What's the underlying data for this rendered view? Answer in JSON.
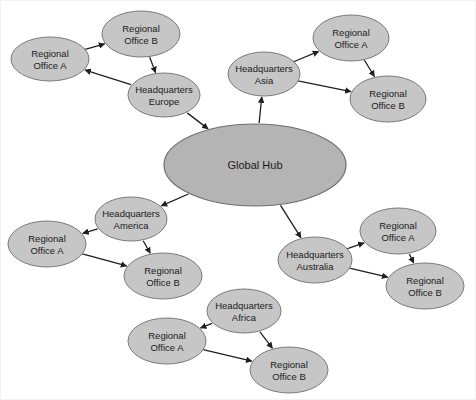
{
  "diagram": {
    "type": "node-link-graph",
    "colors": {
      "node_fill": "#c6c6c6",
      "node_stroke": "#7a7a7a",
      "hub_fill": "#b4b4b4",
      "hub_stroke": "#6e6e6e",
      "edge": "#1f1f1f",
      "background": "#ffffff"
    },
    "hub": {
      "id": "global-hub",
      "label": "Global Hub",
      "cx": 254,
      "cy": 164,
      "rx": 91,
      "ry": 41
    },
    "clusters": [
      {
        "id": "europe",
        "region": "Europe",
        "hq": {
          "id": "hq-europe",
          "label_line1": "Headquarters",
          "label_line2": "Europe",
          "cx": 163,
          "cy": 94,
          "rx": 36,
          "ry": 22
        },
        "offices": [
          {
            "id": "europe-office-a",
            "label_line1": "Regional",
            "label_line2": "Office A",
            "cx": 49,
            "cy": 58,
            "rx": 39,
            "ry": 22
          },
          {
            "id": "europe-office-b",
            "label_line1": "Regional",
            "label_line2": "Office B",
            "cx": 140,
            "cy": 33,
            "rx": 39,
            "ry": 23
          }
        ]
      },
      {
        "id": "asia",
        "region": "Asia",
        "hq": {
          "id": "hq-asia",
          "label_line1": "Headquarters",
          "label_line2": "Asia",
          "cx": 263,
          "cy": 73,
          "rx": 36,
          "ry": 22
        },
        "offices": [
          {
            "id": "asia-office-a",
            "label_line1": "Regional",
            "label_line2": "Office A",
            "cx": 350,
            "cy": 37,
            "rx": 38,
            "ry": 23
          },
          {
            "id": "asia-office-b",
            "label_line1": "Regional",
            "label_line2": "Office B",
            "cx": 387,
            "cy": 98,
            "rx": 38,
            "ry": 23
          }
        ]
      },
      {
        "id": "america",
        "region": "America",
        "hq": {
          "id": "hq-america",
          "label_line1": "Headquarters",
          "label_line2": "America",
          "cx": 130,
          "cy": 218,
          "rx": 36,
          "ry": 22
        },
        "offices": [
          {
            "id": "america-office-a",
            "label_line1": "Regional",
            "label_line2": "Office A",
            "cx": 46,
            "cy": 243,
            "rx": 39,
            "ry": 23
          },
          {
            "id": "america-office-b",
            "label_line1": "Regional",
            "label_line2": "Office B",
            "cx": 162,
            "cy": 275,
            "rx": 39,
            "ry": 23
          }
        ]
      },
      {
        "id": "australia",
        "region": "Australia",
        "hq": {
          "id": "hq-australia",
          "label_line1": "Headquarters",
          "label_line2": "Australia",
          "cx": 314,
          "cy": 259,
          "rx": 37,
          "ry": 23
        },
        "offices": [
          {
            "id": "australia-office-a",
            "label_line1": "Regional",
            "label_line2": "Office A",
            "cx": 397,
            "cy": 230,
            "rx": 38,
            "ry": 23
          },
          {
            "id": "australia-office-b",
            "label_line1": "Regional",
            "label_line2": "Office B",
            "cx": 424,
            "cy": 285,
            "rx": 39,
            "ry": 23
          }
        ]
      },
      {
        "id": "africa",
        "region": "Africa",
        "hq": {
          "id": "hq-africa",
          "label_line1": "Headquarters",
          "label_line2": "Africa",
          "cx": 243,
          "cy": 310,
          "rx": 37,
          "ry": 22
        },
        "offices": [
          {
            "id": "africa-office-a",
            "label_line1": "Regional",
            "label_line2": "Office A",
            "cx": 166,
            "cy": 340,
            "rx": 39,
            "ry": 23
          },
          {
            "id": "africa-office-b",
            "label_line1": "Regional",
            "label_line2": "Office B",
            "cx": 288,
            "cy": 369,
            "rx": 39,
            "ry": 23
          }
        ]
      }
    ],
    "edges": [
      {
        "id": "e-hub-europe",
        "from": "hq-europe",
        "to": "global-hub",
        "arrow": "to"
      },
      {
        "id": "e-hub-asia",
        "from": "global-hub",
        "to": "hq-asia",
        "arrow": "to"
      },
      {
        "id": "e-hub-america",
        "from": "global-hub",
        "to": "hq-america",
        "arrow": "to"
      },
      {
        "id": "e-hub-australia",
        "from": "global-hub",
        "to": "hq-australia",
        "arrow": "to"
      },
      {
        "id": "e-eu-hq-ofa",
        "from": "hq-europe",
        "to": "europe-office-a",
        "arrow": "to"
      },
      {
        "id": "e-eu-ofa-ofb",
        "from": "europe-office-a",
        "to": "europe-office-b",
        "arrow": "both"
      },
      {
        "id": "e-eu-ofb-hq",
        "from": "europe-office-b",
        "to": "hq-europe",
        "arrow": "both"
      },
      {
        "id": "e-as-hq-ofa",
        "from": "hq-asia",
        "to": "asia-office-a",
        "arrow": "both"
      },
      {
        "id": "e-as-ofa-ofb",
        "from": "asia-office-a",
        "to": "asia-office-b",
        "arrow": "both"
      },
      {
        "id": "e-as-hq-ofb",
        "from": "hq-asia",
        "to": "asia-office-b",
        "arrow": "both"
      },
      {
        "id": "e-am-hq-ofa",
        "from": "hq-america",
        "to": "america-office-a",
        "arrow": "to"
      },
      {
        "id": "e-am-hq-ofb",
        "from": "hq-america",
        "to": "america-office-b",
        "arrow": "to"
      },
      {
        "id": "e-am-ofa-ofb",
        "from": "america-office-a",
        "to": "america-office-b",
        "arrow": "both"
      },
      {
        "id": "e-au-hq-ofa",
        "from": "hq-australia",
        "to": "australia-office-a",
        "arrow": "both"
      },
      {
        "id": "e-au-ofa-ofb",
        "from": "australia-office-a",
        "to": "australia-office-b",
        "arrow": "to"
      },
      {
        "id": "e-au-hq-ofb",
        "from": "hq-australia",
        "to": "australia-office-b",
        "arrow": "both"
      },
      {
        "id": "e-af-hq-ofa",
        "from": "hq-africa",
        "to": "africa-office-a",
        "arrow": "to"
      },
      {
        "id": "e-af-hq-ofb",
        "from": "hq-africa",
        "to": "africa-office-b",
        "arrow": "to"
      },
      {
        "id": "e-af-ofa-ofb",
        "from": "africa-office-a",
        "to": "africa-office-b",
        "arrow": "both"
      }
    ]
  }
}
